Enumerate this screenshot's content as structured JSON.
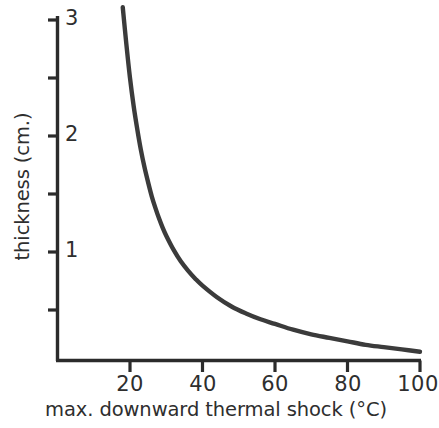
{
  "chart_data": {
    "type": "line",
    "title": "",
    "xlabel": "max. downward thermal shock (°C)",
    "ylabel": "thickness (cm.)",
    "xlim": [
      0,
      101
    ],
    "ylim": [
      0,
      3.15
    ],
    "grid": false,
    "legend": null,
    "xticks": [
      20,
      40,
      60,
      80,
      100
    ],
    "xtick_labels": [
      "20",
      "40",
      "60",
      "80",
      "100"
    ],
    "yticks": [
      0.5,
      1,
      1.5,
      2,
      2.5,
      3
    ],
    "ytick_labels": [
      "",
      "1",
      "",
      "2",
      "",
      "3"
    ],
    "ymajor_labels": [
      "1",
      "2",
      "3"
    ],
    "series": [
      {
        "name": "thickness vs max. downward thermal shock",
        "x": [
          18.0,
          19.0,
          20.0,
          21.0,
          22.0,
          23.0,
          24.0,
          25.0,
          26.0,
          27.0,
          28.0,
          29.0,
          30.0,
          32.0,
          34.0,
          36.0,
          38.0,
          40.0,
          44.0,
          48.0,
          52.0,
          56.0,
          60.0,
          65.0,
          70.0,
          75.0,
          80.0,
          85.0,
          90.0,
          95.0,
          100.0
        ],
        "y": [
          3.11,
          2.79,
          2.5,
          2.26,
          2.06,
          1.88,
          1.73,
          1.6,
          1.48,
          1.38,
          1.29,
          1.21,
          1.14,
          1.02,
          0.92,
          0.84,
          0.77,
          0.71,
          0.61,
          0.53,
          0.47,
          0.42,
          0.38,
          0.33,
          0.29,
          0.26,
          0.23,
          0.2,
          0.18,
          0.16,
          0.14
        ]
      }
    ],
    "curve_color": "#3b3b3b",
    "axis_color": "#2b2b2b",
    "background_color": "#ffffff"
  },
  "axes": {
    "x_tick_labels": [
      {
        "value": "20",
        "x": 20
      },
      {
        "value": "40",
        "x": 40
      },
      {
        "value": "60",
        "x": 60
      },
      {
        "value": "80",
        "x": 80
      },
      {
        "value": "100",
        "x": 100
      }
    ],
    "y_tick_labels": [
      {
        "value": "1",
        "y": 1
      },
      {
        "value": "2",
        "y": 2
      },
      {
        "value": "3",
        "y": 3
      }
    ],
    "x_title": "max. downward thermal shock (°C)",
    "y_title": "thickness (cm.)"
  }
}
